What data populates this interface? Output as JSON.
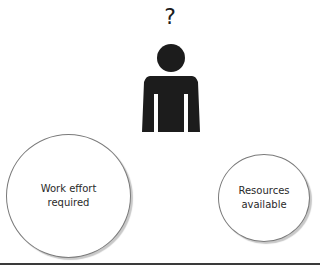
{
  "diagram": {
    "question_mark": "?",
    "person_icon": "person-silhouette",
    "circles": [
      {
        "line1": "Work effort",
        "line2": "required"
      },
      {
        "line1": "Resources",
        "line2": "available"
      }
    ],
    "colors": {
      "figure": "#1c1c1c",
      "circle_stroke": "#7a7a7a",
      "rule": "#3a3a3a"
    }
  }
}
